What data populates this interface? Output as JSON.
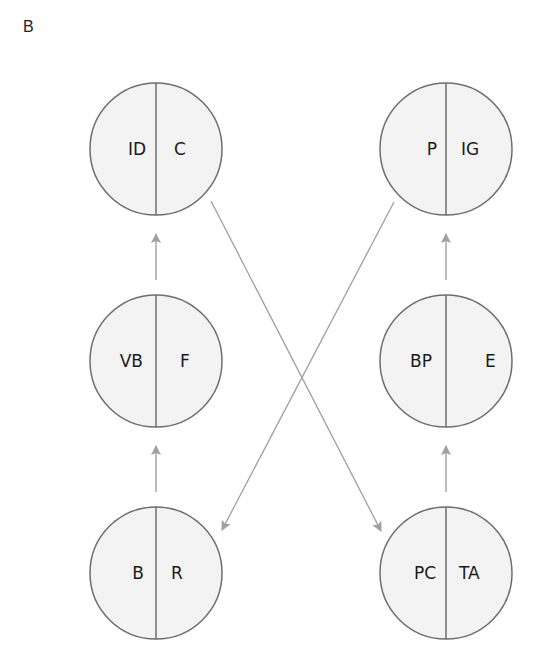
{
  "panel_label": "B",
  "colors": {
    "circle_fill": "#f3f3f3",
    "circle_stroke": "#6e6e6e",
    "arrow": "#a0a0a0",
    "text": "#1a1a1a"
  },
  "nodes": [
    {
      "id": "top-left",
      "left": "ID",
      "right": "C",
      "cx": 156,
      "cy": 149
    },
    {
      "id": "top-right",
      "left": "P",
      "right": "IG",
      "cx": 446,
      "cy": 149
    },
    {
      "id": "mid-left",
      "left": "VB",
      "right": "F",
      "cx": 156,
      "cy": 361
    },
    {
      "id": "mid-right",
      "left": "BP",
      "right": "E",
      "cx": 446,
      "cy": 361
    },
    {
      "id": "bottom-left",
      "left": "B",
      "right": "R",
      "cx": 156,
      "cy": 573
    },
    {
      "id": "bottom-right",
      "left": "PC",
      "right": "TA",
      "cx": 446,
      "cy": 573
    }
  ],
  "edges": [
    {
      "from": "bottom-left",
      "to": "mid-left",
      "type": "vertical"
    },
    {
      "from": "mid-left",
      "to": "top-left",
      "type": "vertical"
    },
    {
      "from": "bottom-right",
      "to": "mid-right",
      "type": "vertical"
    },
    {
      "from": "mid-right",
      "to": "top-right",
      "type": "vertical"
    },
    {
      "from": "top-left",
      "to": "bottom-right",
      "type": "diagonal"
    },
    {
      "from": "top-right",
      "to": "bottom-left",
      "type": "diagonal"
    }
  ]
}
